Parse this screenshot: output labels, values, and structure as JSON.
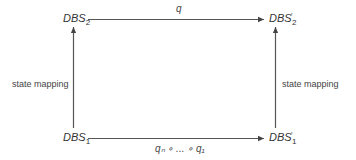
{
  "diagram": {
    "nodes": {
      "top_left": {
        "base": "DBS",
        "sub": "2",
        "prime": ""
      },
      "top_right": {
        "base": "DBS",
        "sub": "2",
        "prime": "′"
      },
      "bottom_left": {
        "base": "DBS",
        "sub": "1",
        "prime": ""
      },
      "bottom_right": {
        "base": "DBS",
        "sub": "1",
        "prime": "′"
      }
    },
    "edges": {
      "top": {
        "label": "q",
        "from": "DBS2",
        "to": "DBS2'"
      },
      "bottom": {
        "label": "qₙ ∘ ... ∘ q₁",
        "from": "DBS1",
        "to": "DBS1'"
      },
      "left": {
        "label": "state mapping",
        "from": "DBS1",
        "to": "DBS2"
      },
      "right": {
        "label": "state mapping",
        "from": "DBS1'",
        "to": "DBS2'"
      }
    },
    "colors": {
      "line": "#444444",
      "text": "#333333"
    }
  }
}
